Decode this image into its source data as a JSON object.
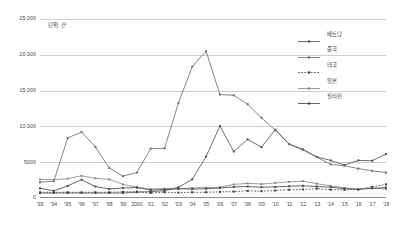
{
  "chart_data": {
    "type": "line",
    "title": "",
    "subtitle": "",
    "unit_note": "단위: 건",
    "xlabel": "",
    "ylabel": "",
    "ylim": [
      0,
      25000
    ],
    "grid": true,
    "legend_position": "right",
    "yticks": [
      "0",
      "5000",
      "10,000",
      "15,000",
      "20,000",
      "25,000"
    ],
    "ytick_values": [
      0,
      5000,
      10000,
      15000,
      20000,
      25000
    ],
    "categories": [
      "'93",
      "'94",
      "'95",
      "'96",
      "'97",
      "'98",
      "'99",
      "2000",
      "'01",
      "'02",
      "'03",
      "'04",
      "'05",
      "'06",
      "'07",
      "'08",
      "'09",
      "'10",
      "'11",
      "'12",
      "'13",
      "'14",
      "'15",
      "'16",
      "'17",
      "'18"
    ],
    "series": [
      {
        "name": "베트남",
        "marker": "square",
        "line": "solid",
        "color": "#555555",
        "values": [
          700,
          700,
          700,
          700,
          700,
          700,
          700,
          800,
          900,
          1000,
          1500,
          2600,
          5800,
          10050,
          6500,
          8200,
          7100,
          9550,
          7550,
          6800,
          5750,
          5250,
          4600,
          5250,
          5200,
          6150
        ]
      },
      {
        "name": "중국",
        "marker": "square",
        "line": "solid",
        "color": "#707070",
        "values": [
          2200,
          2350,
          8400,
          9200,
          7150,
          4200,
          3050,
          3550,
          6900,
          6950,
          13250,
          18350,
          20500,
          14450,
          14350,
          13100,
          11200,
          9450,
          7500,
          6700,
          5700,
          4700,
          4500,
          4100,
          3800,
          3550
        ]
      },
      {
        "name": "태국",
        "marker": "square",
        "line": "dotted",
        "color": "#3c3c3c",
        "values": [
          800,
          800,
          800,
          800,
          800,
          800,
          850,
          900,
          700,
          800,
          750,
          800,
          800,
          850,
          900,
          1000,
          950,
          1050,
          1150,
          1200,
          1300,
          1150,
          1150,
          1200,
          1550,
          1900
        ]
      },
      {
        "name": "일본",
        "marker": "square",
        "line": "solid",
        "color": "#8a8a8a",
        "values": [
          2600,
          2550,
          2700,
          3100,
          2750,
          2600,
          1900,
          1500,
          1250,
          1300,
          1300,
          1400,
          1450,
          1500,
          1900,
          2050,
          1950,
          2100,
          2250,
          2350,
          2000,
          1700,
          1400,
          1250,
          1400,
          1250
        ]
      },
      {
        "name": "필리핀",
        "marker": "square",
        "line": "solid",
        "color": "#4a4a4a",
        "values": [
          1350,
          1000,
          1700,
          2550,
          1600,
          1250,
          1400,
          1450,
          1100,
          1200,
          1300,
          1250,
          1300,
          1400,
          1550,
          1600,
          1500,
          1550,
          1650,
          1700,
          1600,
          1500,
          1300,
          1200,
          1350,
          1450
        ]
      }
    ]
  }
}
